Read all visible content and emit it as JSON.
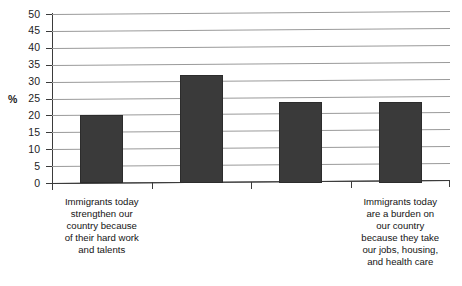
{
  "chart_data": {
    "type": "bar",
    "title": "",
    "subtitle": "",
    "xlabel": "",
    "ylabel": "%",
    "ylim": [
      0,
      50
    ],
    "ytick_step": 5,
    "yticks": [
      "50",
      "45",
      "40",
      "35",
      "30",
      "25",
      "20",
      "15",
      "10",
      "5",
      "0"
    ],
    "grid": true,
    "grid_orientation": "horizontal",
    "legend": "none",
    "bar_color": "#3a3a3a",
    "gridline_color": "#9a9a9a",
    "axis_color": "#3b3b3b",
    "categories": [
      "Immigrants today\nstrengthen our\ncountry because\nof their hard work\nand talents",
      "",
      "",
      "Immigrants today\nare a burden on\nour country\nbecause they take\nour jobs, housing,\nand health care"
    ],
    "values": [
      20,
      32,
      24,
      24
    ]
  }
}
